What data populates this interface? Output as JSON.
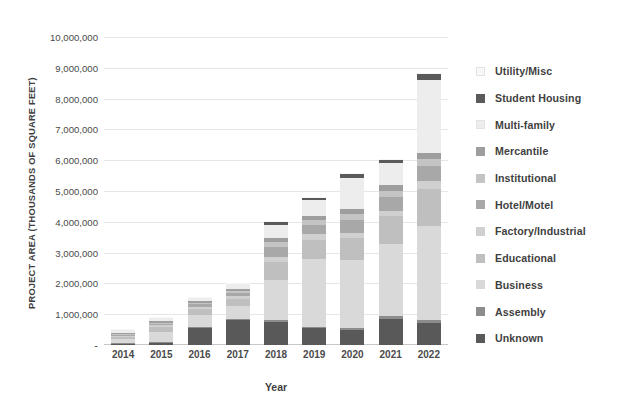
{
  "chart_data": {
    "type": "bar",
    "subtype": "stacked-bar",
    "title": "",
    "xlabel": "Year",
    "ylabel": "PROJECT AREA (THOUSANDS OF SQUARE FEET)",
    "categories": [
      "2014",
      "2015",
      "2016",
      "2017",
      "2018",
      "2019",
      "2020",
      "2021",
      "2022"
    ],
    "ylim": [
      0,
      10000000
    ],
    "ytick_values": [
      0,
      1000000,
      2000000,
      3000000,
      4000000,
      5000000,
      6000000,
      7000000,
      8000000,
      9000000,
      10000000
    ],
    "ytick_labels": [
      "-",
      "1,000,000",
      "2,000,000",
      "3,000,000",
      "4,000,000",
      "5,000,000",
      "6,000,000",
      "7,000,000",
      "8,000,000",
      "9,000,000",
      "10,000,000"
    ],
    "grid": true,
    "grid_axis": "y",
    "legend_position": "right",
    "stack_order_bottom_to_top": [
      "Unknown",
      "Assembly",
      "Business",
      "Educational",
      "Factory/Industrial",
      "Hotel/Motel",
      "Institutional",
      "Mercantile",
      "Multi-family",
      "Student Housing",
      "Utility/Misc"
    ],
    "series": [
      {
        "name": "Unknown",
        "color": "#595959",
        "values": [
          40000,
          90000,
          560000,
          800000,
          740000,
          540000,
          490000,
          840000,
          700000
        ]
      },
      {
        "name": "Assembly",
        "color": "#8c8c8c",
        "values": [
          20000,
          15000,
          25000,
          40000,
          60000,
          55000,
          70000,
          90000,
          110000
        ]
      },
      {
        "name": "Business",
        "color": "#d9d9d9",
        "values": [
          120000,
          310000,
          390000,
          420000,
          1300000,
          2200000,
          2200000,
          2350000,
          3050000
        ]
      },
      {
        "name": "Educational",
        "color": "#bfbfbf",
        "values": [
          90000,
          180000,
          210000,
          250000,
          580000,
          630000,
          700000,
          900000,
          1200000
        ]
      },
      {
        "name": "Factory/Industrial",
        "color": "#d0d0d0",
        "values": [
          30000,
          40000,
          60000,
          80000,
          180000,
          180000,
          180000,
          180000,
          250000
        ]
      },
      {
        "name": "Hotel/Motel",
        "color": "#a8a8a8",
        "values": [
          45000,
          60000,
          90000,
          110000,
          330000,
          300000,
          420000,
          430000,
          500000
        ]
      },
      {
        "name": "Institutional",
        "color": "#c4c4c4",
        "values": [
          25000,
          35000,
          45000,
          60000,
          150000,
          140000,
          180000,
          200000,
          240000
        ]
      },
      {
        "name": "Mercantile",
        "color": "#9e9e9e",
        "values": [
          30000,
          40000,
          55000,
          70000,
          140000,
          130000,
          180000,
          190000,
          190000
        ]
      },
      {
        "name": "Multi-family",
        "color": "#ededed",
        "values": [
          90000,
          110000,
          100000,
          150000,
          410000,
          540000,
          1010000,
          730000,
          2360000
        ]
      },
      {
        "name": "Student Housing",
        "color": "#5a5a5a",
        "values": [
          10000,
          12000,
          15000,
          20000,
          110000,
          60000,
          120000,
          110000,
          190000
        ]
      },
      {
        "name": "Utility/Misc",
        "color": "#f7f7f7",
        "values": [
          10000,
          8000,
          10000,
          10000,
          20000,
          25000,
          30000,
          30000,
          40000
        ]
      }
    ],
    "totals": [
      510000,
      900000,
      1560000,
      2010000,
      4020000,
      4800000,
      5580000,
      6050000,
      8830000
    ]
  },
  "axes": {
    "y_title": "PROJECT AREA (THOUSANDS OF SQUARE FEET)",
    "x_title": "Year"
  },
  "legend": {
    "items": [
      {
        "label": "Utility/Misc",
        "color": "#f7f7f7"
      },
      {
        "label": "Student Housing",
        "color": "#5a5a5a"
      },
      {
        "label": "Multi-family",
        "color": "#ededed"
      },
      {
        "label": "Mercantile",
        "color": "#9e9e9e"
      },
      {
        "label": "Institutional",
        "color": "#c4c4c4"
      },
      {
        "label": "Hotel/Motel",
        "color": "#a8a8a8"
      },
      {
        "label": "Factory/Industrial",
        "color": "#d0d0d0"
      },
      {
        "label": "Educational",
        "color": "#bfbfbf"
      },
      {
        "label": "Business",
        "color": "#d9d9d9"
      },
      {
        "label": "Assembly",
        "color": "#8c8c8c"
      },
      {
        "label": "Unknown",
        "color": "#595959"
      }
    ]
  },
  "style": {
    "gridline_color": "#e6e6e6",
    "axis_color": "#c8c8c8",
    "text_color": "#3f3f3f",
    "background": "#ffffff"
  }
}
